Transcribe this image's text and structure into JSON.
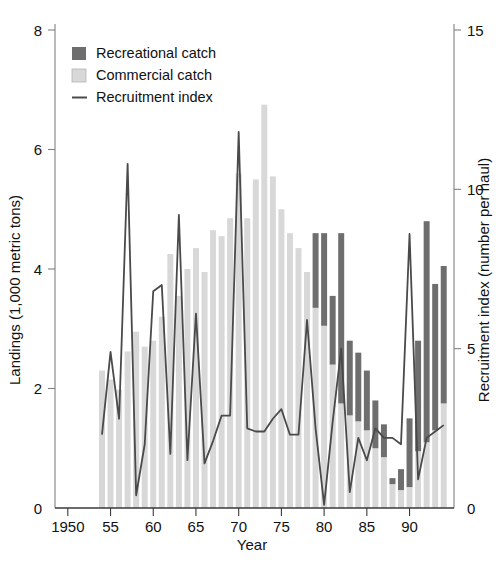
{
  "chart_data": {
    "type": "bar",
    "title": "",
    "xlabel": "Year",
    "ylabel": "Landings (1,000 metric tons)",
    "y2label": "Recruitment index (number per haul)",
    "xlim": [
      1948.5,
      1994.5
    ],
    "ylim": [
      0,
      8
    ],
    "y2lim": [
      0,
      15
    ],
    "xticks": [
      1950,
      1955,
      1960,
      1965,
      1970,
      1975,
      1980,
      1985,
      1990
    ],
    "xticklabels": [
      "1950",
      "55",
      "60",
      "65",
      "70",
      "75",
      "80",
      "85",
      "90"
    ],
    "yticks": [
      0,
      2,
      4,
      6,
      8
    ],
    "yticklabels": [
      "0",
      "2",
      "4",
      "6",
      "8"
    ],
    "y2ticks": [
      0,
      5,
      10,
      15
    ],
    "y2ticklabels": [
      "0",
      "5",
      "10",
      "15"
    ],
    "grid": false,
    "legend_position": "top-left",
    "bar_mode": "stacked",
    "colors": {
      "recreational": "#6e6e6e",
      "commercial": "#d8d8d8",
      "line": "#4a4a4a",
      "axis": "#808080",
      "text": "#111111",
      "background": "#ffffff"
    },
    "legend": [
      {
        "label": "Recreational catch",
        "marker": "filled-square-dark"
      },
      {
        "label": "Commercial catch",
        "marker": "filled-square-light"
      },
      {
        "label": "Recruitment index",
        "marker": "line"
      }
    ],
    "x": [
      1954,
      1955,
      1956,
      1957,
      1958,
      1959,
      1960,
      1961,
      1962,
      1963,
      1964,
      1965,
      1966,
      1967,
      1968,
      1969,
      1970,
      1971,
      1972,
      1973,
      1974,
      1975,
      1976,
      1977,
      1978,
      1979,
      1980,
      1981,
      1982,
      1983,
      1984,
      1985,
      1986,
      1987,
      1988,
      1989,
      1990,
      1991,
      1992,
      1993,
      1994
    ],
    "series": [
      {
        "name": "Commercial catch",
        "units": "1,000 metric tons",
        "values": [
          2.3,
          2.15,
          1.98,
          2.62,
          2.95,
          2.7,
          2.8,
          3.2,
          4.25,
          3.55,
          4.0,
          4.35,
          3.95,
          4.65,
          4.55,
          4.85,
          5.6,
          4.85,
          5.5,
          6.75,
          5.55,
          5.0,
          4.6,
          4.35,
          3.95,
          3.35,
          3.05,
          2.4,
          1.75,
          1.55,
          1.45,
          1.3,
          1.0,
          0.85,
          0.4,
          0.3,
          0.35,
          0.95,
          1.1,
          1.3,
          1.75
        ]
      },
      {
        "name": "Recreational catch",
        "units": "1,000 metric tons",
        "values": [
          0,
          0,
          0,
          0,
          0,
          0,
          0,
          0,
          0,
          0,
          0,
          0,
          0,
          0,
          0,
          0,
          0,
          0,
          0,
          0,
          0,
          0,
          0,
          0,
          0,
          1.25,
          1.55,
          1.15,
          2.85,
          1.25,
          1.15,
          1.0,
          0.8,
          0.55,
          0.1,
          0.35,
          1.15,
          1.85,
          3.7,
          2.45,
          2.3
        ]
      },
      {
        "name": "Recruitment index",
        "units": "number per haul",
        "axis": "right",
        "values": [
          2.3,
          4.9,
          2.8,
          10.8,
          0.4,
          2.0,
          6.8,
          7.0,
          1.7,
          9.2,
          1.5,
          6.1,
          1.4,
          2.1,
          2.9,
          2.9,
          11.8,
          2.5,
          2.4,
          2.4,
          2.8,
          3.1,
          2.3,
          2.3,
          5.9,
          2.5,
          0.1,
          2.7,
          5.0,
          0.5,
          2.2,
          1.5,
          2.5,
          2.2,
          2.2,
          2.0,
          8.6,
          0.9,
          2.2,
          2.4,
          2.6
        ]
      }
    ]
  }
}
